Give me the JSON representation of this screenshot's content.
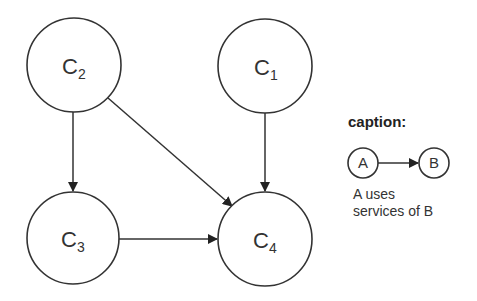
{
  "diagram": {
    "nodes": [
      {
        "id": "C2",
        "base": "C",
        "sub": "2",
        "cx": 74,
        "cy": 65,
        "r": 47
      },
      {
        "id": "C1",
        "base": "C",
        "sub": "1",
        "cx": 265,
        "cy": 66,
        "r": 47
      },
      {
        "id": "C3",
        "base": "C",
        "sub": "3",
        "cx": 73,
        "cy": 238,
        "r": 46
      },
      {
        "id": "C4",
        "base": "C",
        "sub": "4",
        "cx": 265,
        "cy": 239,
        "r": 47
      }
    ],
    "edges": [
      {
        "from": "C2",
        "to": "C3"
      },
      {
        "from": "C2",
        "to": "C4"
      },
      {
        "from": "C1",
        "to": "C4"
      },
      {
        "from": "C3",
        "to": "C4"
      }
    ],
    "colors": {
      "stroke": "#333333",
      "background": "#ffffff"
    }
  },
  "caption": {
    "title": "caption:",
    "node_a": "A",
    "node_b": "B",
    "line1": "A uses",
    "line2": "services of B"
  }
}
